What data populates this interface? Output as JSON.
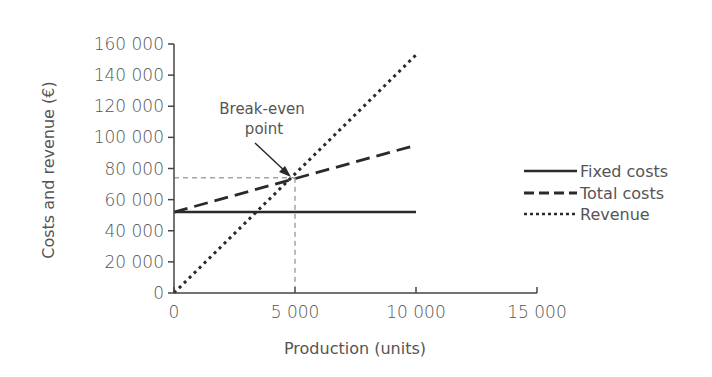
{
  "chart_data": {
    "type": "line",
    "title": "",
    "xlabel": "Production (units)",
    "ylabel": "Costs and revenue (€)",
    "xlim": [
      0,
      15000
    ],
    "ylim": [
      0,
      160000
    ],
    "x_ticks": [
      0,
      5000,
      10000,
      15000
    ],
    "x_tick_labels": [
      "0",
      "5 000",
      "10 000",
      "15 000"
    ],
    "y_ticks": [
      0,
      20000,
      40000,
      60000,
      80000,
      100000,
      120000,
      140000,
      160000
    ],
    "y_tick_labels": [
      "0",
      "20 000",
      "40 000",
      "60 000",
      "80 000",
      "100 000",
      "120 000",
      "140 000",
      "160 000"
    ],
    "grid": false,
    "legend_position": "right",
    "series": [
      {
        "name": "Fixed costs",
        "style": "solid",
        "x": [
          0,
          10000
        ],
        "values": [
          52000,
          52000
        ]
      },
      {
        "name": "Total costs",
        "style": "dashed",
        "x": [
          0,
          10000
        ],
        "values": [
          52000,
          95000
        ]
      },
      {
        "name": "Revenue",
        "style": "dotted",
        "x": [
          0,
          10000
        ],
        "values": [
          0,
          153000
        ]
      }
    ],
    "annotations": [
      {
        "text": "Break-even point",
        "x": 5000,
        "y": 74000,
        "arrow": true,
        "guide_lines": "dashed to both axes"
      }
    ]
  },
  "labels": {
    "annotation_line1": "Break-even",
    "annotation_line2": "point"
  },
  "colors": {
    "line": "#2a2a2a",
    "text": "#555555",
    "guide": "#777777"
  }
}
